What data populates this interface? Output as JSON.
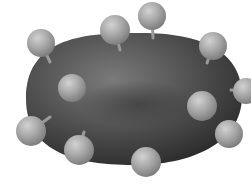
{
  "image": {
    "description": "Grayscale illustration of a red blood cell with surface antigens",
    "background": "#ffffff",
    "cell": {
      "cx": 134,
      "cy": 99,
      "rx": 108,
      "ry": 66,
      "color_dark": "#2a2a2a",
      "color_mid": "#5a5a5a",
      "highlight": "#8a8a8a"
    },
    "antigens": [
      {
        "cx": 41,
        "cy": 43,
        "r": 14,
        "stem": [
          50,
          62
        ]
      },
      {
        "cx": 115,
        "cy": 30,
        "r": 15,
        "stem": [
          120,
          50
        ]
      },
      {
        "cx": 152,
        "cy": 16,
        "r": 14,
        "stem": [
          153,
          38
        ]
      },
      {
        "cx": 213,
        "cy": 46,
        "r": 14,
        "stem": [
          207,
          63
        ]
      },
      {
        "cx": 72,
        "cy": 88,
        "r": 14,
        "stem": null
      },
      {
        "cx": 246,
        "cy": 91,
        "r": 13,
        "stem": [
          231,
          90
        ]
      },
      {
        "cx": 202,
        "cy": 106,
        "r": 15,
        "stem": null
      },
      {
        "cx": 31,
        "cy": 131,
        "r": 15,
        "stem": [
          50,
          117
        ]
      },
      {
        "cx": 79,
        "cy": 150,
        "r": 15,
        "stem": [
          84,
          132
        ]
      },
      {
        "cx": 229,
        "cy": 134,
        "r": 14,
        "stem": null
      },
      {
        "cx": 146,
        "cy": 162,
        "r": 15,
        "stem": null
      }
    ],
    "sphere_color": "#a8a8a8"
  }
}
